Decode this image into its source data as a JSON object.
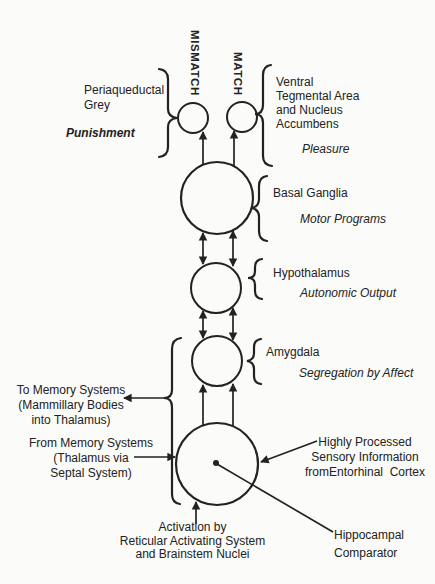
{
  "theme": {
    "ink": "#222222",
    "paper": "#fbfbf9"
  },
  "figure": {
    "comparator_outputs": {
      "mismatch": "MISMATCH",
      "match": "MATCH"
    },
    "nodes": {
      "periaqueductal": {
        "name_lines": [
          "Periaqueductal",
          "Grey"
        ],
        "function": "Punishment"
      },
      "vta": {
        "name_lines": [
          "Ventral",
          "Tegmental Area",
          "and Nucleus",
          "Accumbens"
        ],
        "function": "Pleasure"
      },
      "basal_ganglia": {
        "name": "Basal Ganglia",
        "function": "Motor Programs"
      },
      "hypothalamus": {
        "name": "Hypothalamus",
        "function": "Autonomic Output"
      },
      "amygdala": {
        "name": "Amygdala",
        "function": "Segregation by Affect"
      },
      "hippocampus": {
        "name_lines": [
          "Hippocampal",
          "Comparator"
        ]
      }
    },
    "annotations": {
      "to_memory": [
        "To Memory Systems",
        "(Mammillary Bodies",
        "into Thalamus)"
      ],
      "from_memory": [
        "From Memory Systems",
        "(Thalamus via",
        "Septal System)"
      ],
      "sensory_input": [
        "Highly Processed",
        "Sensory Information",
        "fromEntorhinal  Cortex"
      ],
      "activation": [
        "Activation by",
        "Reticular Activating System",
        "and Brainstem Nuclei"
      ]
    }
  }
}
